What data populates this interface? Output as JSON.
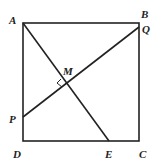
{
  "diagram": {
    "type": "geometry",
    "points": {
      "A": {
        "label": "A",
        "x": 23,
        "y": 23
      },
      "B": {
        "label": "B",
        "x": 139,
        "y": 23
      },
      "C": {
        "label": "C",
        "x": 139,
        "y": 141
      },
      "D": {
        "label": "D",
        "x": 23,
        "y": 141
      },
      "E": {
        "label": "E",
        "x": 109,
        "y": 141
      },
      "P": {
        "label": "P",
        "x": 23,
        "y": 117
      },
      "Q": {
        "label": "Q",
        "x": 139,
        "y": 27
      },
      "M": {
        "label": "M",
        "x": 66,
        "y": 83
      }
    },
    "segments": [
      "AB",
      "BC",
      "CD",
      "DA",
      "AE",
      "PQ"
    ],
    "right_angle_at": "M",
    "stroke_color": "#222222"
  }
}
